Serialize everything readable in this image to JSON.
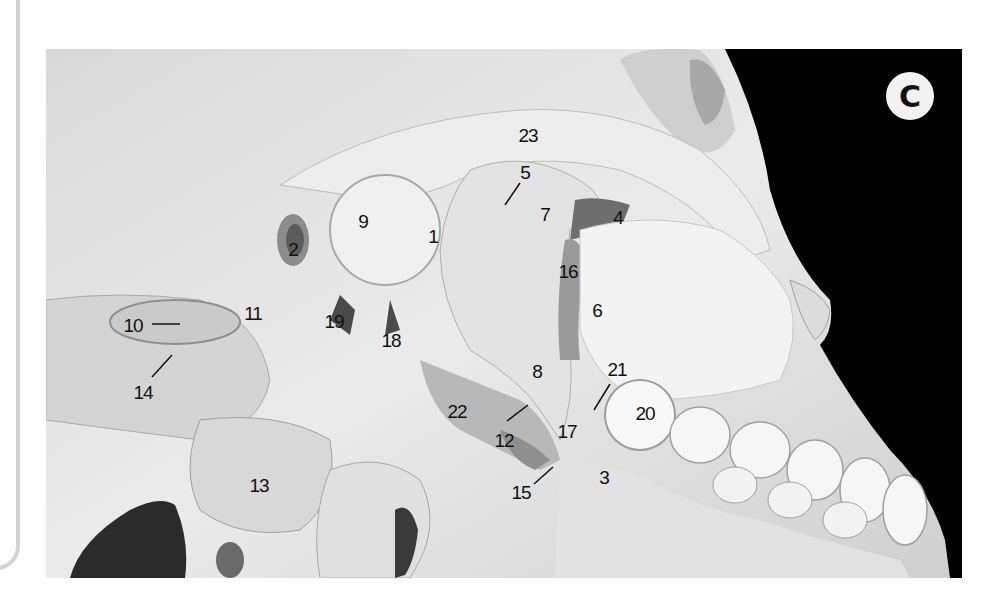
{
  "figure": {
    "panel_letter": "C",
    "colors": {
      "background_panel": "#000000",
      "bone": "#e6e6e6",
      "badge_bg": "#f2f2f2",
      "label_text": "#111111",
      "frame_border": "#d3d3d3"
    },
    "labels": [
      {
        "id": "1",
        "text": "1",
        "x": 433,
        "y": 236
      },
      {
        "id": "2",
        "text": "2",
        "x": 293,
        "y": 249
      },
      {
        "id": "3",
        "text": "3",
        "x": 604,
        "y": 477
      },
      {
        "id": "4",
        "text": "4",
        "x": 618,
        "y": 217
      },
      {
        "id": "5",
        "text": "5",
        "x": 525,
        "y": 172
      },
      {
        "id": "6",
        "text": "6",
        "x": 597,
        "y": 310
      },
      {
        "id": "7",
        "text": "7",
        "x": 545,
        "y": 214
      },
      {
        "id": "8",
        "text": "8",
        "x": 537,
        "y": 371
      },
      {
        "id": "9",
        "text": "9",
        "x": 363,
        "y": 221
      },
      {
        "id": "10",
        "text": "10",
        "x": 133,
        "y": 325
      },
      {
        "id": "11",
        "text": "11",
        "x": 253,
        "y": 313
      },
      {
        "id": "12",
        "text": "12",
        "x": 504,
        "y": 440
      },
      {
        "id": "13",
        "text": "13",
        "x": 259,
        "y": 485
      },
      {
        "id": "14",
        "text": "14",
        "x": 143,
        "y": 392
      },
      {
        "id": "15",
        "text": "15",
        "x": 521,
        "y": 492
      },
      {
        "id": "16",
        "text": "16",
        "x": 568,
        "y": 271
      },
      {
        "id": "17",
        "text": "17",
        "x": 567,
        "y": 431
      },
      {
        "id": "18",
        "text": "18",
        "x": 391,
        "y": 340
      },
      {
        "id": "19",
        "text": "19",
        "x": 334,
        "y": 321
      },
      {
        "id": "20",
        "text": "20",
        "x": 645,
        "y": 413
      },
      {
        "id": "21",
        "text": "21",
        "x": 617,
        "y": 369
      },
      {
        "id": "22",
        "text": "22",
        "x": 457,
        "y": 411
      },
      {
        "id": "23",
        "text": "23",
        "x": 528,
        "y": 135
      }
    ],
    "leader_lines": [
      {
        "label": "10",
        "x1": 152,
        "y1": 324,
        "x2": 180,
        "y2": 324
      },
      {
        "label": "14",
        "x1": 152,
        "y1": 377,
        "x2": 172,
        "y2": 355
      },
      {
        "label": "12",
        "x1": 507,
        "y1": 421,
        "x2": 528,
        "y2": 405
      },
      {
        "label": "15",
        "x1": 534,
        "y1": 484,
        "x2": 553,
        "y2": 467
      },
      {
        "label": "21",
        "x1": 594,
        "y1": 410,
        "x2": 610,
        "y2": 384
      },
      {
        "label": "5",
        "x1": 520,
        "y1": 183,
        "x2": 505,
        "y2": 205
      }
    ]
  }
}
